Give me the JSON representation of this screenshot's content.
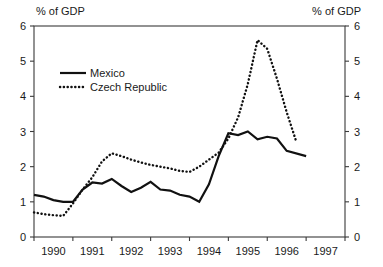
{
  "chart_data": {
    "type": "line",
    "title": "",
    "xlabel": "",
    "ylabel": "% of GDP",
    "y2label": "% of GDP",
    "left_axis_caption": "% of GDP",
    "right_axis_caption": "% of GDP",
    "xlim": [
      1989.5,
      1997.5
    ],
    "ylim": [
      0,
      6
    ],
    "yticks": [
      0,
      1,
      2,
      3,
      4,
      5,
      6
    ],
    "ytick_labels": [
      "0",
      "1",
      "2",
      "3",
      "4",
      "5",
      "6"
    ],
    "y2ticks": [
      0,
      1,
      2,
      3,
      4,
      5,
      6
    ],
    "y2tick_labels": [
      "0",
      "1",
      "2",
      "3",
      "4",
      "5",
      "6"
    ],
    "xticks": [
      1990,
      1991,
      1992,
      1993,
      1994,
      1995,
      1996,
      1997
    ],
    "xtick_labels": [
      "1990",
      "1991",
      "1992",
      "1993",
      "1994",
      "1995",
      "1996",
      "1997"
    ],
    "grid": false,
    "legend_position": "upper-left-inside",
    "series": [
      {
        "name": "Mexico",
        "style": "solid",
        "color": "#111111",
        "x": [
          1989.5,
          1989.75,
          1990.0,
          1990.25,
          1990.5,
          1990.75,
          1991.0,
          1991.25,
          1991.5,
          1991.75,
          1992.0,
          1992.25,
          1992.5,
          1992.75,
          1993.0,
          1993.25,
          1993.5,
          1993.75,
          1994.0,
          1994.25,
          1994.5,
          1994.75,
          1995.0,
          1995.25,
          1995.5,
          1995.75,
          1996.0,
          1996.25
        ],
        "values": [
          1.2,
          1.15,
          1.05,
          1.0,
          1.0,
          1.35,
          1.55,
          1.52,
          1.65,
          1.45,
          1.28,
          1.4,
          1.57,
          1.35,
          1.32,
          1.2,
          1.15,
          1.0,
          1.5,
          2.3,
          2.95,
          2.9,
          3.0,
          2.78,
          2.85,
          2.9,
          2.83,
          2.8
        ]
      },
      {
        "name": "Czech Republic",
        "style": "dotted",
        "color": "#111111",
        "x": [
          1989.5,
          1989.75,
          1990.0,
          1990.25,
          1990.5,
          1990.75,
          1991.0,
          1991.25,
          1991.5,
          1991.75,
          1992.0,
          1992.25,
          1992.5,
          1992.75,
          1993.0,
          1993.25,
          1993.5,
          1993.75,
          1994.0,
          1994.25,
          1994.5,
          1994.75,
          1995.0,
          1995.25,
          1995.5,
          1995.75,
          1996.0,
          1996.25
        ],
        "values": [
          0.7,
          0.65,
          0.62,
          0.6,
          0.95,
          1.35,
          1.7,
          2.15,
          2.38,
          2.3,
          2.2,
          2.12,
          2.05,
          2.0,
          1.95,
          1.88,
          1.85,
          2.0,
          2.2,
          2.4,
          2.8,
          3.4,
          4.35,
          5.6,
          5.35,
          4.5,
          3.55,
          2.7
        ]
      }
    ],
    "mexico_tail": {
      "x": [
        1995.75,
        1996.0,
        1996.5
      ],
      "values": [
        2.8,
        2.45,
        2.3
      ]
    },
    "annotations": []
  },
  "legend": {
    "items": [
      {
        "label": "Mexico",
        "style": "solid"
      },
      {
        "label": "Czech Republic",
        "style": "dotted"
      }
    ]
  }
}
